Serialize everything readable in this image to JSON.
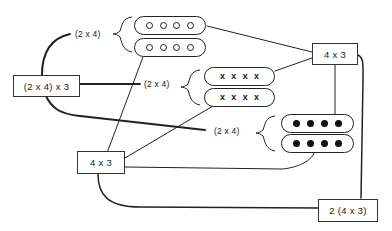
{
  "diagram": {
    "nodes": {
      "root_left": "(2 x 4) x 3",
      "hub_top_right": "4 x 3",
      "hub_bottom_left": "4 x 3",
      "result_bottom_right": "2 (4  x 3)"
    },
    "group_labels": {
      "open_group": "(2 x 4)",
      "cross_group": "(2 x 4)",
      "filled_group": "(2 x 4)"
    },
    "pill_groups": [
      {
        "name": "open-circles",
        "symbol": "open-circle",
        "rows": 2,
        "per_row": 4
      },
      {
        "name": "crosses",
        "symbol": "x",
        "glyph": "x",
        "rows": 2,
        "per_row": 4
      },
      {
        "name": "filled-dots",
        "symbol": "filled-dot",
        "rows": 2,
        "per_row": 4
      }
    ],
    "colors": {
      "stroke": "#222222",
      "background": "#ffffff"
    }
  }
}
